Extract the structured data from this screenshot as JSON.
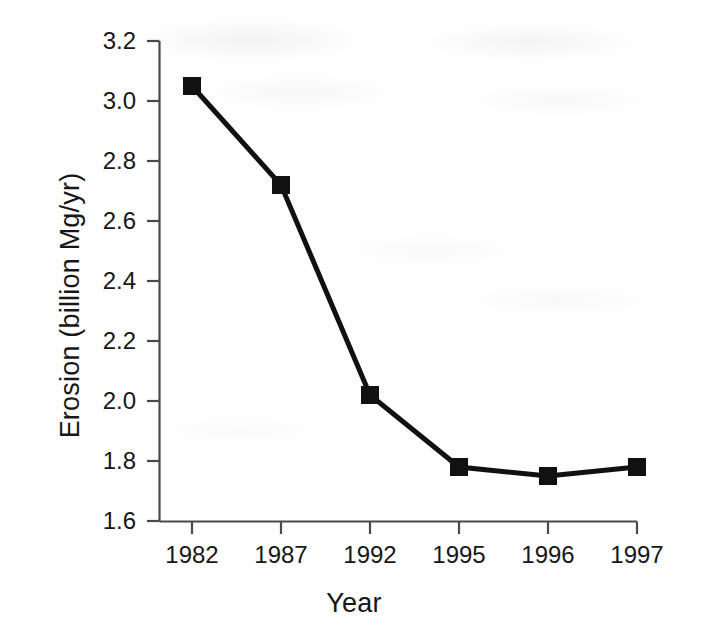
{
  "chart_data": {
    "type": "line",
    "title": "",
    "xlabel": "Year",
    "ylabel": "Erosion (billion Mg/yr)",
    "categories": [
      "1982",
      "1987",
      "1992",
      "1995",
      "1996",
      "1997"
    ],
    "values": [
      3.05,
      2.72,
      2.02,
      1.78,
      1.75,
      1.78
    ],
    "series": [
      {
        "name": "Erosion",
        "values": [
          3.05,
          2.72,
          2.02,
          1.78,
          1.75,
          1.78
        ]
      }
    ],
    "ylim": [
      1.6,
      3.2
    ],
    "ytick_step": 0.2,
    "yticks": [
      "3.2",
      "3.0",
      "2.8",
      "2.6",
      "2.4",
      "2.2",
      "2.0",
      "1.8",
      "1.6"
    ],
    "ytick_values": [
      3.2,
      3.0,
      2.8,
      2.6,
      2.4,
      2.2,
      2.0,
      1.8,
      1.6
    ],
    "xticks": [
      "1982",
      "1987",
      "1992",
      "1995",
      "1996",
      "1997"
    ],
    "grid": false,
    "legend": false,
    "legend_position": "none",
    "marker": "square",
    "line_color": "#111111",
    "marker_color": "#111111",
    "axis_color": "#4a4a4a",
    "background_color": "#fefefe"
  },
  "axes": {
    "x_title": "Year",
    "y_title": "Erosion (billion Mg/yr)"
  }
}
